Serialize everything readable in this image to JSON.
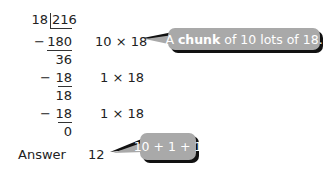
{
  "division": {
    "divisor": "18",
    "dividend": "216",
    "steps": [
      {
        "sign": "−",
        "value": "180",
        "note": "10 × 18"
      },
      {
        "remainder": "36"
      },
      {
        "sign": "−",
        "value": "18",
        "note": "1 × 18"
      },
      {
        "remainder": "18"
      },
      {
        "sign": "−",
        "value": "18",
        "note": "1 × 18"
      },
      {
        "remainder": "0"
      }
    ]
  },
  "answer": {
    "label": "Answer",
    "value": "12"
  },
  "callouts": {
    "chunk": {
      "prefix": "A ",
      "bold": "chunk",
      "suffix": " of 10 lots of 18."
    },
    "sum": {
      "text": "10 + 1 + 1"
    }
  },
  "colors": {
    "bubble": "#a9a9a9",
    "shadow": "#111111",
    "text": "#222222"
  }
}
